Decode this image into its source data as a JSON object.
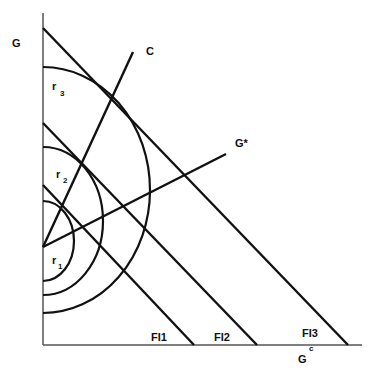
{
  "diagram": {
    "axes": {
      "y_label": "G",
      "x_label": "G",
      "x_label_superscript": "c"
    },
    "rays": [
      {
        "id": "C",
        "label": "C"
      },
      {
        "id": "G*",
        "label": "G*"
      }
    ],
    "frontiers": [
      {
        "id": "FI1",
        "label": "FI1"
      },
      {
        "id": "FI2",
        "label": "FI2"
      },
      {
        "id": "FI3",
        "label": "FI3"
      }
    ],
    "arcs": [
      {
        "id": "r1",
        "label": "r",
        "subscript": "1"
      },
      {
        "id": "r2",
        "label": "r",
        "subscript": "2"
      },
      {
        "id": "r3",
        "label": "r",
        "subscript": "3"
      }
    ],
    "colors": {
      "ink": "#111111",
      "background": "#ffffff",
      "axis": "#555555"
    }
  }
}
